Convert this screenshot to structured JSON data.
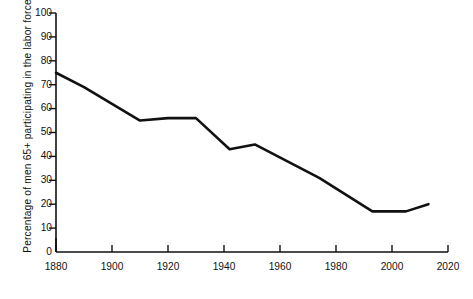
{
  "chart_data": {
    "type": "line",
    "title": "",
    "xlabel": "",
    "ylabel": "Percentage of men 65+ participating in the labor force",
    "xlim": [
      1880,
      2020
    ],
    "ylim": [
      0,
      100
    ],
    "grid": false,
    "legend": "none",
    "xticks": [
      "1880",
      "1900",
      "1920",
      "1940",
      "1960",
      "1980",
      "2000",
      "2020"
    ],
    "yticks": [
      "0",
      "10",
      "20",
      "30",
      "40",
      "50",
      "60",
      "70",
      "80",
      "90",
      "100"
    ],
    "series": [
      {
        "name": "Men 65+ labor force participation",
        "color": "#111111",
        "x": [
          1880,
          1890,
          1910,
          1920,
          1930,
          1942,
          1951,
          1974,
          1993,
          2005,
          2013
        ],
        "values": [
          75,
          69,
          55,
          56,
          56,
          43,
          45,
          31,
          17,
          17,
          20
        ]
      }
    ]
  }
}
